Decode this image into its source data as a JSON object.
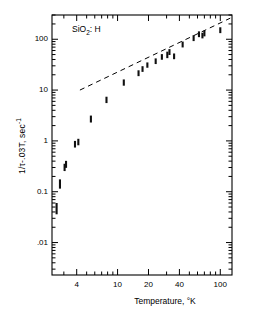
{
  "chart_data": {
    "type": "scatter",
    "title": "SiO2: H",
    "title_parts": {
      "pre": "SiO",
      "sub": "2",
      "post": ": H"
    },
    "xlabel": "Temperature, °K",
    "ylabel": "1/τ-.03T, sec",
    "ylabel_sup": "-1",
    "xscale": "log",
    "yscale": "log",
    "xlim": [
      2.3,
      130
    ],
    "ylim": [
      0.0023,
      300
    ],
    "grid": false,
    "legend": null,
    "xticks": [
      4,
      10,
      20,
      40,
      100
    ],
    "xtick_labels": [
      "4",
      "10",
      "20",
      "40",
      "100"
    ],
    "yticks": [
      100,
      10,
      1,
      0.1,
      0.01
    ],
    "ytick_labels": [
      "100",
      "10",
      "1",
      "0.1",
      ".01"
    ],
    "series": [
      {
        "name": "1/τ-.03T data",
        "marker": "vertical-error-bar",
        "points": [
          {
            "x": 2.55,
            "y": 0.046,
            "ylow": 0.036,
            "yhigh": 0.06
          },
          {
            "x": 2.75,
            "y": 0.14,
            "ylow": 0.115,
            "yhigh": 0.175
          },
          {
            "x": 3.05,
            "y": 0.3,
            "ylow": 0.255,
            "yhigh": 0.355
          },
          {
            "x": 3.15,
            "y": 0.345,
            "ylow": 0.295,
            "yhigh": 0.405
          },
          {
            "x": 3.85,
            "y": 0.86,
            "ylow": 0.74,
            "yhigh": 1.0
          },
          {
            "x": 4.15,
            "y": 0.95,
            "ylow": 0.82,
            "yhigh": 1.1
          },
          {
            "x": 5.5,
            "y": 2.7,
            "ylow": 2.3,
            "yhigh": 3.15
          },
          {
            "x": 7.8,
            "y": 6.4,
            "ylow": 5.55,
            "yhigh": 7.4
          },
          {
            "x": 11.5,
            "y": 14.0,
            "ylow": 12.2,
            "yhigh": 16.2
          },
          {
            "x": 16.0,
            "y": 21.5,
            "ylow": 18.8,
            "yhigh": 24.5
          },
          {
            "x": 17.5,
            "y": 26.0,
            "ylow": 22.8,
            "yhigh": 29.5
          },
          {
            "x": 19.5,
            "y": 31.0,
            "ylow": 27.5,
            "yhigh": 35.0
          },
          {
            "x": 23.5,
            "y": 37.0,
            "ylow": 32.5,
            "yhigh": 42.0
          },
          {
            "x": 27.0,
            "y": 45.0,
            "ylow": 39.5,
            "yhigh": 51.0
          },
          {
            "x": 30.5,
            "y": 49.0,
            "ylow": 42.5,
            "yhigh": 57.0
          },
          {
            "x": 32.0,
            "y": 56.0,
            "ylow": 49.0,
            "yhigh": 64.0
          },
          {
            "x": 35.5,
            "y": 46.0,
            "ylow": 40.5,
            "yhigh": 52.5
          },
          {
            "x": 43.0,
            "y": 79.0,
            "ylow": 69.0,
            "yhigh": 90.0
          },
          {
            "x": 55.0,
            "y": 105.0,
            "ylow": 92.0,
            "yhigh": 120.0
          },
          {
            "x": 62.0,
            "y": 125.0,
            "ylow": 110.0,
            "yhigh": 143.0
          },
          {
            "x": 67.0,
            "y": 118.0,
            "ylow": 104.0,
            "yhigh": 134.0
          },
          {
            "x": 70.0,
            "y": 130.0,
            "ylow": 114.0,
            "yhigh": 148.0
          },
          {
            "x": 100.0,
            "y": 150.0,
            "ylow": 132.0,
            "yhigh": 172.0
          }
        ]
      }
    ],
    "annotations": [
      {
        "type": "dashed-line",
        "label": "T-linear reference line",
        "x_start": 4.3,
        "y_start": 10.0,
        "x_end": 125.0,
        "y_end": 260.0
      }
    ],
    "axis_color": "#000000",
    "data_color": "#101010"
  }
}
